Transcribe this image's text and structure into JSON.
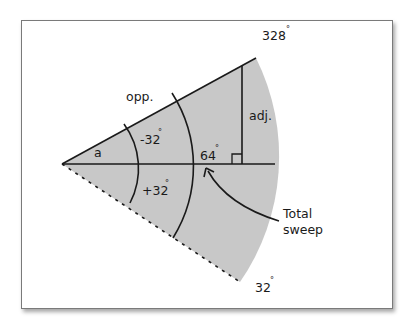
{
  "diagram": {
    "title": "",
    "labels": {
      "angle_a": "a",
      "opp": "opp.",
      "adj": "adj.",
      "minus_32": "-32",
      "plus_32": "+32",
      "center_64": "64",
      "top_328": "328",
      "bottom_32": "32",
      "degree_symbol": "°",
      "total_line1": "Total",
      "total_line2": "sweep"
    },
    "colors": {
      "fan_fill": "#c8c8c8",
      "line": "#1a1a1a",
      "frame_border": "#7a7a7a",
      "background": "#ffffff"
    },
    "geometry": {
      "apex": [
        62,
        164
      ],
      "fan_radius": 218,
      "upper_edge_angle_deg": 328,
      "lower_edge_angle_deg": 32,
      "inner_arc_radius": 75,
      "outer_arc_radius": 136
    }
  }
}
